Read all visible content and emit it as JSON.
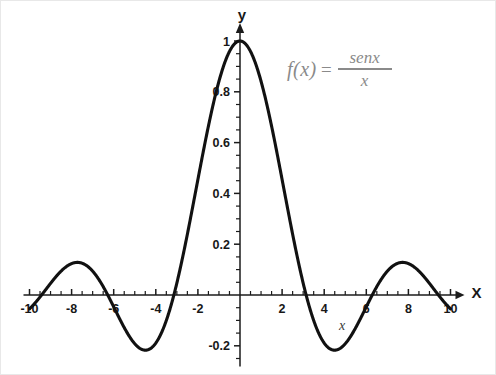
{
  "figure": {
    "background": "#ffffff",
    "curve_color": "#111111",
    "axis_color": "#1b1b1b",
    "formula_color": "#8a8a8a"
  },
  "formula": {
    "lhs": "f(x)",
    "equals": "=",
    "numerator": "senx",
    "denominator": "x"
  },
  "axes": {
    "y_axis_name": "y",
    "x_axis_name": "X",
    "x_axis_title": "x"
  },
  "chart_data": {
    "type": "line",
    "title": "",
    "subtitle": "",
    "xlabel": "x",
    "ylabel": "y",
    "annotations": [
      {
        "text": "f(x) = senx / x",
        "x": 5.0,
        "y": 0.88
      }
    ],
    "legend": [],
    "legend_position": "none",
    "grid": false,
    "xlim": [
      -10,
      10
    ],
    "ylim": [
      -0.25,
      1.05
    ],
    "xticks": [
      -10,
      -8,
      -6,
      -4,
      -2,
      2,
      4,
      6,
      8,
      10
    ],
    "xtick_labels": [
      "-10",
      "-8",
      "-6",
      "-4",
      "-2",
      "2",
      "4",
      "6",
      "8",
      "10"
    ],
    "x_minor_tick_step": 0.5,
    "yticks": [
      0.2,
      0.4,
      0.6,
      0.8,
      1
    ],
    "ytick_labels_positive": [
      "0.2",
      "0.4",
      "0.6",
      "0.8",
      "1"
    ],
    "yticks_negative": [
      -0.2
    ],
    "ytick_labels_negative": [
      "-0.2"
    ],
    "y_minor_tick_step": 0.05,
    "series": [
      {
        "name": "sin(x)/x",
        "expression": "sin(x)/x",
        "color": "#111111",
        "x": [
          -10,
          -9.75,
          -9.5,
          -9.25,
          -9,
          -8.75,
          -8.5,
          -8.25,
          -8,
          -7.75,
          -7.5,
          -7.25,
          -7,
          -6.75,
          -6.5,
          -6.25,
          -6,
          -5.75,
          -5.5,
          -5.25,
          -5,
          -4.75,
          -4.5,
          -4.25,
          -4,
          -3.75,
          -3.5,
          -3.25,
          -3,
          -2.75,
          -2.5,
          -2.25,
          -2,
          -1.75,
          -1.5,
          -1.25,
          -1,
          -0.75,
          -0.5,
          -0.25,
          0,
          0.25,
          0.5,
          0.75,
          1,
          1.25,
          1.5,
          1.75,
          2,
          2.25,
          2.5,
          2.75,
          3,
          3.25,
          3.5,
          3.75,
          4,
          4.25,
          4.5,
          4.75,
          5,
          5.25,
          5.5,
          5.75,
          6,
          6.25,
          6.5,
          6.75,
          7,
          7.25,
          7.5,
          7.75,
          8,
          8.25,
          8.5,
          8.75,
          9,
          9.25,
          9.5,
          9.75,
          10
        ],
        "y": [
          -0.0544,
          -0.0387,
          -0.0079,
          0.0317,
          0.0458,
          0.0731,
          0.0935,
          0.1059,
          0.1237,
          0.1276,
          0.1251,
          0.1161,
          0.0939,
          0.0681,
          0.0345,
          -0.0005,
          -0.0466,
          -0.0852,
          -0.1269,
          -0.1597,
          -0.1918,
          -0.2064,
          -0.2172,
          -0.2095,
          -0.1892,
          -0.1533,
          -0.1002,
          -0.0339,
          0.047,
          0.1394,
          0.2394,
          0.3453,
          0.4546,
          0.5623,
          0.665,
          0.7582,
          0.8415,
          0.9089,
          0.9589,
          0.9896,
          1.0,
          0.9896,
          0.9589,
          0.9089,
          0.8415,
          0.7582,
          0.665,
          0.5623,
          0.4546,
          0.3453,
          0.2394,
          0.1394,
          0.047,
          -0.0339,
          -0.1002,
          -0.1533,
          -0.1892,
          -0.2095,
          -0.2172,
          -0.2064,
          -0.1918,
          -0.1597,
          -0.1269,
          -0.0852,
          -0.0466,
          -0.0005,
          0.0345,
          0.0681,
          0.0939,
          0.1161,
          0.1251,
          0.1276,
          0.1237,
          0.1059,
          0.0935,
          0.0731,
          0.0458,
          0.0317,
          -0.0079,
          -0.0387,
          -0.0544
        ],
        "key_points": {
          "global_max": {
            "x": 0,
            "y": 1.0
          },
          "minima": [
            {
              "x": -4.49,
              "y": -0.217
            },
            {
              "x": 4.49,
              "y": -0.217
            }
          ],
          "side_maxima": [
            {
              "x": -7.73,
              "y": 0.128
            },
            {
              "x": 7.73,
              "y": 0.128
            }
          ],
          "zeros": [
            -9.42,
            -6.28,
            -3.14,
            3.14,
            6.28,
            9.42
          ]
        }
      }
    ]
  }
}
